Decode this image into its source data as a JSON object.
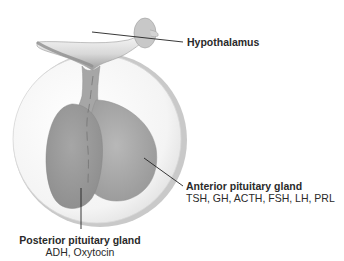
{
  "diagram": {
    "labels": {
      "hypothalamus": {
        "title": "Hypothalamus"
      },
      "anterior": {
        "title": "Anterior pituitary gland",
        "hormones": "TSH, GH, ACTH, FSH, LH, PRL"
      },
      "posterior": {
        "title": "Posterior pituitary gland",
        "hormones": "ADH, Oxytocin"
      }
    },
    "colors": {
      "background": "#ffffff",
      "circle_fill": "#f6f6f6",
      "circle_rim": "#c8c8c8",
      "gland_fill": "#a4a4a4",
      "gland_shade": "#8c8c8c",
      "text": "#2a2a2a",
      "leader_line": "#222222"
    }
  }
}
